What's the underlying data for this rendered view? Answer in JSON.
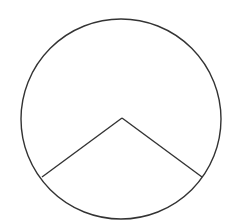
{
  "diagram": {
    "type": "circle-sector",
    "stroke_color": "#333333",
    "background": "#ffffff",
    "circle": {
      "cx": 121,
      "cy": 119,
      "r": 100
    },
    "apex": {
      "x": 122,
      "y": 118
    },
    "radius_endpoints": [
      {
        "x": 42,
        "y": 177
      },
      {
        "x": 202,
        "y": 177
      }
    ],
    "labels": []
  }
}
